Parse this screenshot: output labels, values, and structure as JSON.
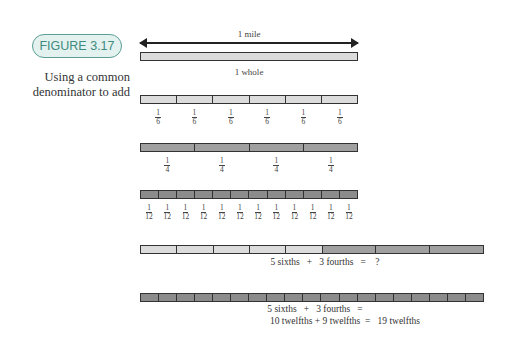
{
  "figure": {
    "badge": "FIGURE 3.17",
    "caption": "Using a common denominator to add",
    "badge_color": "#5a9e94"
  },
  "rows": {
    "mile_label": "1 mile",
    "whole_label": "1 whole",
    "sixths": {
      "count": 6,
      "fraction": {
        "num": "1",
        "den": "6"
      }
    },
    "fourths": {
      "count": 4,
      "fraction": {
        "num": "1",
        "den": "4"
      }
    },
    "twelfths": {
      "count": 12,
      "fraction": {
        "num": "1",
        "den": "12"
      }
    },
    "combined": {
      "light_segments": 5,
      "mid_segments": 3,
      "equation": "5 sixths   +   3 fourths   =    ?"
    },
    "combined_twelfths": {
      "segments": 19,
      "equation_line1": "5 sixths   +   3 fourths   =",
      "equation_line2": "10 twelfths + 9 twelfths  =   19 twelfths"
    }
  },
  "colors": {
    "light": "#dcdcdc",
    "mid": "#a0a0a0",
    "dark": "#8c8c8c"
  }
}
